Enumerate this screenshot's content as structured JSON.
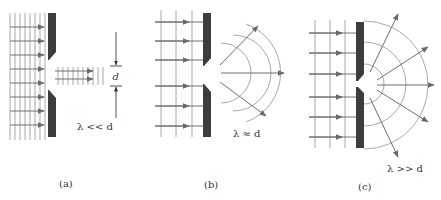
{
  "diagram": {
    "colors": {
      "barrier": "#3c3c3c",
      "wavefront": "#a8a8a8",
      "ray": "#6e6e6e",
      "text": "#333333"
    },
    "panels": [
      {
        "id": "a",
        "caption": "(a)",
        "condition": "λ << d",
        "dimension_label": "d",
        "description": "Short wavelength: wave passes straight through, little diffraction"
      },
      {
        "id": "b",
        "caption": "(b)",
        "condition": "λ ≈ d",
        "description": "Comparable wavelength: noticeable spreading into circular wavefronts"
      },
      {
        "id": "c",
        "caption": "(c)",
        "condition": "λ >> d",
        "description": "Long wavelength: aperture acts as point source, semicircular wavefronts"
      }
    ]
  }
}
